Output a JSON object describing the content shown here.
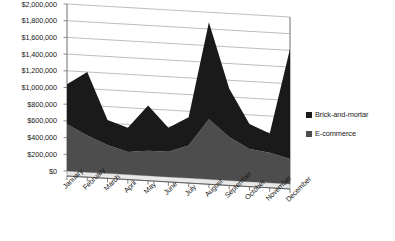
{
  "chart_data": {
    "type": "area",
    "stacked": true,
    "title": "",
    "xlabel": "",
    "ylabel": "",
    "ylim": [
      0,
      2000000
    ],
    "ytick_step": 200000,
    "grid": true,
    "legend_position": "right",
    "categories": [
      "January",
      "February",
      "March",
      "April",
      "May",
      "June",
      "July",
      "August",
      "September",
      "October",
      "November",
      "December"
    ],
    "ytick_labels": [
      "$2,000,000",
      "$1,800,000",
      "$1,600,000",
      "$1,400,000",
      "$1,200,000",
      "$1,000,000",
      "$800,000",
      "$600,000",
      "$400,000",
      "$200,000",
      "$0"
    ],
    "series": [
      {
        "name": "E-commerce",
        "color": "#4d4d4d",
        "values": [
          560000,
          440000,
          340000,
          270000,
          300000,
          300000,
          390000,
          720000,
          520000,
          390000,
          360000,
          300000
        ]
      },
      {
        "name": "Brick-and-mortar",
        "color": "#1a1a1a",
        "values": [
          480000,
          760000,
          300000,
          290000,
          540000,
          290000,
          340000,
          1160000,
          580000,
          300000,
          230000,
          1320000
        ]
      }
    ],
    "totals": [
      1040000,
      1200000,
      640000,
      560000,
      840000,
      590000,
      730000,
      1880000,
      1100000,
      690000,
      590000,
      1620000
    ]
  },
  "legend": {
    "items": [
      {
        "label": "Brick-and-mortar",
        "color": "#1a1a1a",
        "swatch": "legend-swatch-dark"
      },
      {
        "label": "E-commerce",
        "color": "#4d4d4d",
        "swatch": "legend-swatch-gray"
      }
    ]
  },
  "colors": {
    "brick_and_mortar": "#1a1a1a",
    "e_commerce": "#4d4d4d",
    "grid": "#9a9a9a",
    "axis": "#7a7a7a",
    "background": "#ffffff",
    "text": "#1a1a1a"
  }
}
